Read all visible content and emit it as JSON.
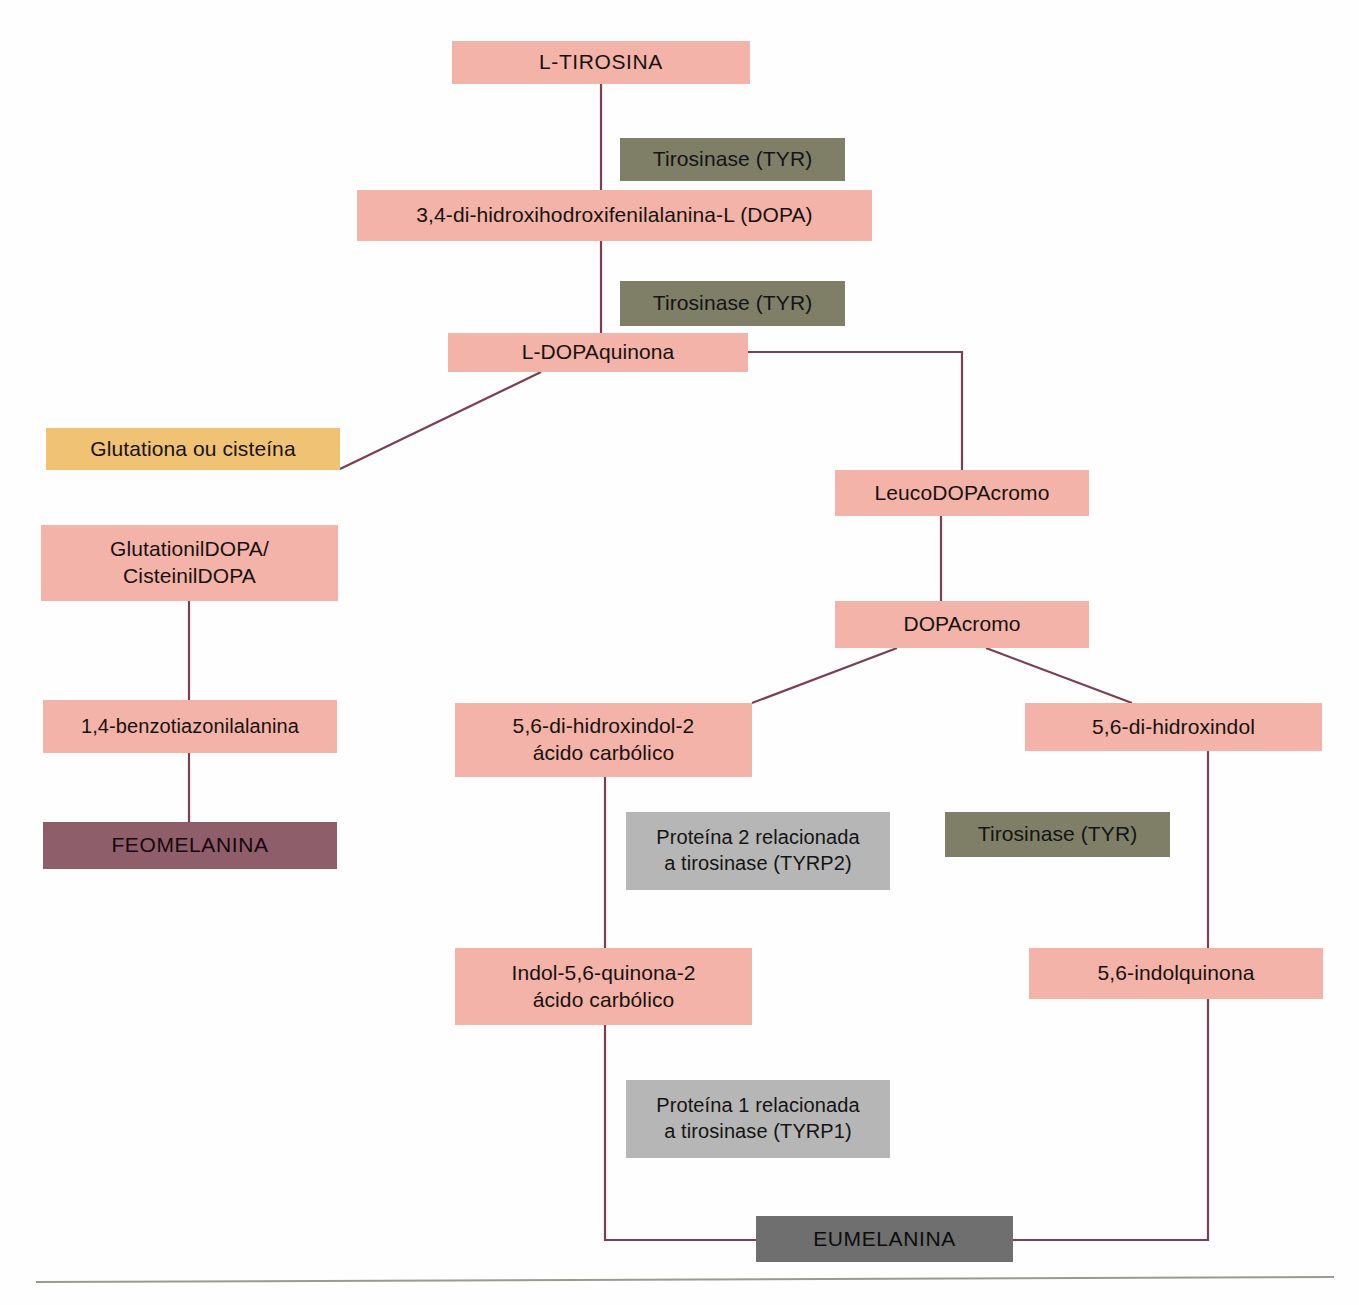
{
  "figure": {
    "language": "pt-BR"
  },
  "colors": {
    "substrate_pink": "#f3b3a8",
    "enzyme_olive": "#7f7f67",
    "cofactor_orange": "#f0c274",
    "pheomelanin_maroon": "#8e5e6b",
    "protein_gray": "#b6b6b6",
    "eumelanin_dark_gray": "#6f6f6f",
    "connector_line": "#7a4050"
  },
  "nodes": {
    "l_tirosina": "L-TIROSINA",
    "tirosinase_1": "Tirosinase (TYR)",
    "dopa": "3,4-di-hidroxihodroxifenilalanina-L (DOPA)",
    "tirosinase_2": "Tirosinase (TYR)",
    "l_dopaquinona": "L-DOPAquinona",
    "glutationa_ou_cisteina": "Glutationa ou cisteína",
    "glutationildopa": "GlutationilDOPA/\nCisteinilDOPA",
    "benzotiazonilalanina": "1,4-benzotiazonilalanina",
    "feomelanina": "FEOMELANINA",
    "leucodopacromo": "LeucoDOPAcromo",
    "dopacromo": "DOPAcromo",
    "dihidroxindol_2_acido": "5,6-di-hidroxindol-2\nácido carbólico",
    "dihidroxindol": "5,6-di-hidroxindol",
    "tyrp2": "Proteína 2 relacionada\na tirosinase (TYRP2)",
    "tirosinase_3": "Tirosinase (TYR)",
    "indolquinona_2_acido": "Indol-5,6-quinona-2\nácido carbólico",
    "indolquinona": "5,6-indolquinona",
    "tyrp1": "Proteína 1 relacionada\na tirosinase (TYRP1)",
    "eumelanina": "EUMELANINA"
  },
  "caption": {
    "text": ""
  }
}
